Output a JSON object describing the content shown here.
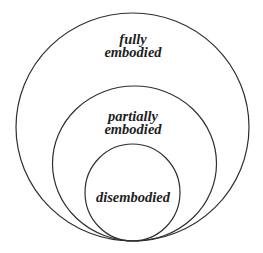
{
  "diagram": {
    "type": "nested-circles",
    "stroke_color": "#2e2e2e",
    "text_color": "#1e1e1e",
    "circles": [
      {
        "id": "outer",
        "label_lines": [
          "fully",
          "embodied"
        ],
        "cx": 132.5,
        "cy": 127,
        "rx": 116.5,
        "ry": 114
      },
      {
        "id": "middle",
        "label_lines": [
          "partially",
          "embodied"
        ],
        "cx": 134.5,
        "cy": 163.5,
        "rx": 82,
        "ry": 77.5
      },
      {
        "id": "inner",
        "label_lines": [
          "disembodied"
        ],
        "cx": 132.5,
        "cy": 192.5,
        "rx": 47.5,
        "ry": 48.5
      }
    ]
  }
}
